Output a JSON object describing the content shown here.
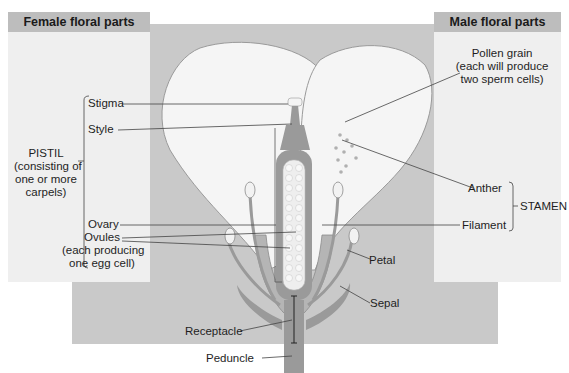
{
  "panels": {
    "female": {
      "title": "Female floral parts"
    },
    "male": {
      "title": "Male floral parts"
    }
  },
  "labels": {
    "stigma": "Stigma",
    "style": "Style",
    "pistil_line1": "PISTIL",
    "pistil_line2": "(consisting of",
    "pistil_line3": "one or more",
    "pistil_line4": "carpels)",
    "ovary": "Ovary",
    "ovules_line1": "Ovules",
    "ovules_line2": "(each producing",
    "ovules_line3": "one egg cell)",
    "pollen_line1": "Pollen grain",
    "pollen_line2": "(each will produce",
    "pollen_line3": "two sperm cells)",
    "anther": "Anther",
    "filament": "Filament",
    "stamen": "STAMEN",
    "petal": "Petal",
    "sepal": "Sepal",
    "receptacle": "Receptacle",
    "peduncle": "Peduncle"
  },
  "colors": {
    "panel_bg": "#efefef",
    "panel_header": "#bdbdbd",
    "backdrop": "#c9c9c9",
    "petal_fill": "#f5f5f5",
    "tissue_dark": "#9a9a9a",
    "tissue_mid": "#b5b5b5"
  }
}
